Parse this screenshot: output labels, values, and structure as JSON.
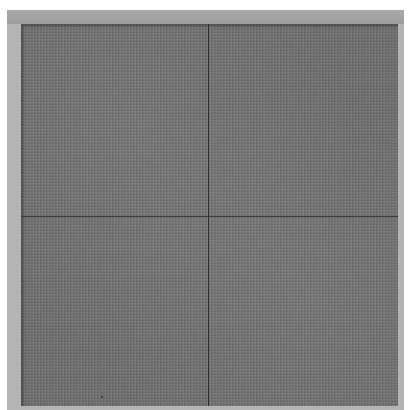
{
  "image": {
    "description": "Grayscale photograph of a finely textured dark gray square sample with a light gray border, divided into four quadrants by a thin dark vertical and horizontal crosshair line",
    "colors": {
      "background": "#ffffff",
      "frame": "#b4b4b4",
      "panel": "#6e6e6e",
      "crosshair": "#2e2e2e"
    },
    "crosshair": {
      "vertical_x_px": 208,
      "horizontal_y_px": 216
    }
  }
}
